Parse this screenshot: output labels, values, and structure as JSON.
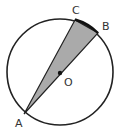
{
  "diagram": {
    "type": "circle-geometry",
    "circle": {
      "cx": 60,
      "cy": 72,
      "r": 53,
      "stroke": "#222222"
    },
    "center": {
      "label": "O",
      "x": 60,
      "y": 73
    },
    "points": [
      {
        "label": "A",
        "x": 24,
        "y": 114
      },
      {
        "label": "B",
        "x": 98,
        "y": 33
      },
      {
        "label": "C",
        "x": 75,
        "y": 20
      }
    ],
    "shaded_region": {
      "vertices": [
        "A",
        "C",
        "B"
      ],
      "fill": "#aaaaaa"
    },
    "labels": {
      "A": "A",
      "B": "B",
      "C": "C",
      "O": "O"
    }
  }
}
